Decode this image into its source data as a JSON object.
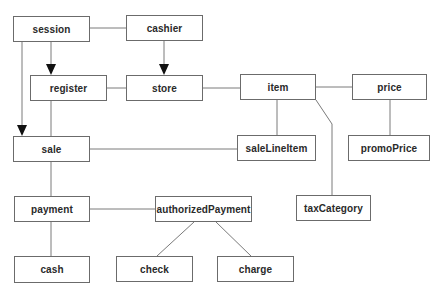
{
  "diagram": {
    "type": "class-association-diagram",
    "colors": {
      "background": "#ffffff",
      "box_border": "#6b6b6b",
      "line": "#7a7a7a",
      "arrow": "#111111",
      "text": "#2a2a2a"
    },
    "nodes": [
      {
        "id": "session",
        "label": "session",
        "x": 13,
        "y": 16,
        "w": 77,
        "h": 26
      },
      {
        "id": "cashier",
        "label": "cashier",
        "x": 126,
        "y": 15,
        "w": 77,
        "h": 26
      },
      {
        "id": "register",
        "label": "register",
        "x": 30,
        "y": 75,
        "w": 77,
        "h": 26
      },
      {
        "id": "store",
        "label": "store",
        "x": 126,
        "y": 75,
        "w": 77,
        "h": 26
      },
      {
        "id": "item",
        "label": "item",
        "x": 240,
        "y": 74,
        "w": 76,
        "h": 26
      },
      {
        "id": "price",
        "label": "price",
        "x": 352,
        "y": 74,
        "w": 75,
        "h": 26
      },
      {
        "id": "sale",
        "label": "sale",
        "x": 13,
        "y": 136,
        "w": 77,
        "h": 26
      },
      {
        "id": "saleLineItem",
        "label": "saleLineItem",
        "x": 237,
        "y": 135,
        "w": 79,
        "h": 26
      },
      {
        "id": "promoPrice",
        "label": "promoPrice",
        "x": 348,
        "y": 135,
        "w": 82,
        "h": 26
      },
      {
        "id": "payment",
        "label": "payment",
        "x": 14,
        "y": 196,
        "w": 76,
        "h": 26
      },
      {
        "id": "authorizedPayment",
        "label": "authorizedPayment",
        "x": 155,
        "y": 196,
        "w": 97,
        "h": 26
      },
      {
        "id": "taxCategory",
        "label": "taxCategory",
        "x": 296,
        "y": 195,
        "w": 75,
        "h": 26
      },
      {
        "id": "cash",
        "label": "cash",
        "x": 14,
        "y": 256,
        "w": 76,
        "h": 27
      },
      {
        "id": "check",
        "label": "check",
        "x": 116,
        "y": 256,
        "w": 77,
        "h": 26
      },
      {
        "id": "charge",
        "label": "charge",
        "x": 217,
        "y": 256,
        "w": 77,
        "h": 26
      }
    ],
    "edges": [
      {
        "from": "session",
        "to": "cashier",
        "arrow": false,
        "points": [
          [
            90,
            28
          ],
          [
            126,
            28
          ]
        ]
      },
      {
        "from": "session",
        "to": "register",
        "arrow": true,
        "points": [
          [
            51,
            42
          ],
          [
            51,
            75
          ]
        ]
      },
      {
        "from": "session",
        "to": "sale",
        "arrow": true,
        "points": [
          [
            22,
            42
          ],
          [
            22,
            136
          ]
        ]
      },
      {
        "from": "cashier",
        "to": "store",
        "arrow": true,
        "points": [
          [
            164,
            41
          ],
          [
            164,
            75
          ]
        ]
      },
      {
        "from": "register",
        "to": "store",
        "arrow": false,
        "points": [
          [
            107,
            88
          ],
          [
            126,
            88
          ]
        ]
      },
      {
        "from": "store",
        "to": "item",
        "arrow": false,
        "points": [
          [
            203,
            88
          ],
          [
            240,
            88
          ]
        ]
      },
      {
        "from": "item",
        "to": "price",
        "arrow": false,
        "points": [
          [
            316,
            87
          ],
          [
            352,
            87
          ]
        ]
      },
      {
        "from": "item",
        "to": "saleLineItem",
        "arrow": false,
        "points": [
          [
            277,
            100
          ],
          [
            277,
            135
          ]
        ]
      },
      {
        "from": "item",
        "to": "taxCategory",
        "arrow": false,
        "points": [
          [
            316,
            100
          ],
          [
            332,
            124
          ],
          [
            332,
            195
          ]
        ]
      },
      {
        "from": "price",
        "to": "promoPrice",
        "arrow": false,
        "points": [
          [
            390,
            100
          ],
          [
            390,
            135
          ]
        ]
      },
      {
        "from": "register",
        "to": "sale",
        "arrow": false,
        "points": [
          [
            51,
            101
          ],
          [
            51,
            136
          ]
        ]
      },
      {
        "from": "sale",
        "to": "saleLineItem",
        "arrow": false,
        "points": [
          [
            90,
            149
          ],
          [
            237,
            149
          ]
        ]
      },
      {
        "from": "sale",
        "to": "payment",
        "arrow": false,
        "points": [
          [
            51,
            162
          ],
          [
            51,
            196
          ]
        ]
      },
      {
        "from": "payment",
        "to": "authorizedPayment",
        "arrow": false,
        "points": [
          [
            90,
            209
          ],
          [
            155,
            209
          ]
        ]
      },
      {
        "from": "payment",
        "to": "cash",
        "arrow": false,
        "points": [
          [
            51,
            222
          ],
          [
            51,
            256
          ]
        ]
      },
      {
        "from": "authorizedPayment",
        "to": "check",
        "arrow": false,
        "points": [
          [
            194,
            222
          ],
          [
            157,
            256
          ]
        ]
      },
      {
        "from": "authorizedPayment",
        "to": "charge",
        "arrow": false,
        "points": [
          [
            216,
            222
          ],
          [
            251,
            256
          ]
        ]
      }
    ]
  }
}
